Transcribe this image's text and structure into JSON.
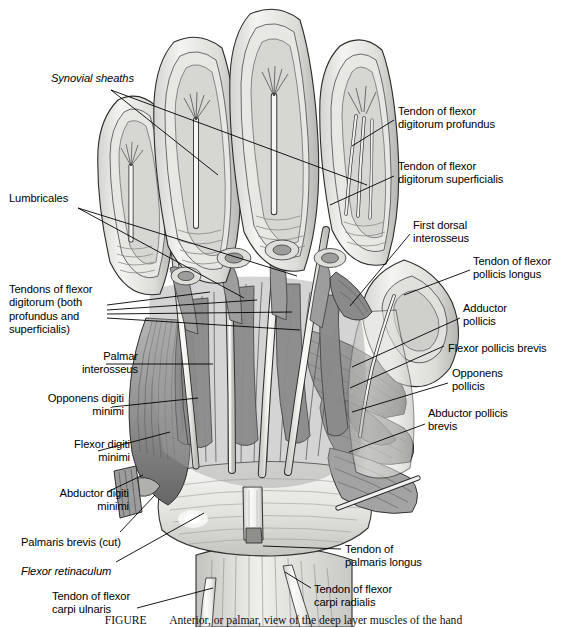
{
  "figure": {
    "domain": "anatomical-illustration",
    "background_color": "#ffffff",
    "ink_color": "#000000",
    "title_region": "Palmar (anterior) view of the dissected right hand showing flexor tendons and intrinsic muscles",
    "caption_prefix": "FIGURE",
    "caption_number": "",
    "caption_text": "FIGURE        Anterior, or palmar, view of the deep layer muscles of the hand",
    "leader_line_color": "#000000",
    "leader_line_width": "0.9"
  },
  "labels_left": [
    {
      "id": "synovial-sheaths",
      "text": "Synovial sheaths",
      "style": "italic",
      "align": "left",
      "x": 51,
      "y": 72,
      "leaders": [
        {
          "x1": 111,
          "y1": 90,
          "x2": 218,
          "y2": 175
        },
        {
          "x1": 111,
          "y1": 90,
          "x2": 367,
          "y2": 185
        }
      ]
    },
    {
      "id": "lumbricales",
      "text": "Lumbricales",
      "style": "regular",
      "align": "left",
      "x": 9,
      "y": 192,
      "leaders": [
        {
          "x1": 78,
          "y1": 208,
          "x2": 244,
          "y2": 298
        },
        {
          "x1": 78,
          "y1": 208,
          "x2": 297,
          "y2": 276
        }
      ]
    },
    {
      "id": "tendons-flexor-digitorum",
      "text": "Tendons of flexor\ndigitorum (both\nprofundus and\nsuperficialis)",
      "style": "regular",
      "align": "left",
      "x": 9,
      "y": 283,
      "leaders": [
        {
          "x1": 107,
          "y1": 305,
          "x2": 210,
          "y2": 292
        },
        {
          "x1": 107,
          "y1": 310,
          "x2": 257,
          "y2": 300
        },
        {
          "x1": 107,
          "y1": 314,
          "x2": 292,
          "y2": 312
        },
        {
          "x1": 107,
          "y1": 318,
          "x2": 300,
          "y2": 330
        }
      ]
    },
    {
      "id": "palmar-interosseus",
      "text": "Palmar\ninterosseus",
      "style": "regular",
      "align": "right",
      "x": 28,
      "y": 350,
      "leaders": [
        {
          "x1": 106,
          "y1": 364,
          "x2": 213,
          "y2": 364
        }
      ]
    },
    {
      "id": "opponens-digiti-minimi",
      "text": "Opponens digiti\nminimi",
      "style": "regular",
      "align": "right",
      "x": 14,
      "y": 392,
      "leaders": [
        {
          "x1": 112,
          "y1": 407,
          "x2": 198,
          "y2": 398
        }
      ]
    },
    {
      "id": "flexor-digiti-minimi",
      "text": "Flexor digiti\nminimi",
      "style": "regular",
      "align": "right",
      "x": 20,
      "y": 438,
      "leaders": [
        {
          "x1": 98,
          "y1": 451,
          "x2": 170,
          "y2": 432
        }
      ]
    },
    {
      "id": "abductor-digiti-minimi",
      "text": "Abductor digiti\nminimi",
      "style": "regular",
      "align": "right",
      "x": 19,
      "y": 487,
      "leaders": [
        {
          "x1": 107,
          "y1": 492,
          "x2": 143,
          "y2": 475
        }
      ]
    },
    {
      "id": "palmaris-brevis-cut",
      "text": "Palmaris brevis (cut)",
      "style": "regular",
      "align": "left",
      "x": 21,
      "y": 536,
      "leaders": [
        {
          "x1": 120,
          "y1": 532,
          "x2": 155,
          "y2": 495
        }
      ]
    },
    {
      "id": "flexor-retinaculum",
      "text": "Flexor retinaculum",
      "style": "italic",
      "align": "left",
      "x": 21,
      "y": 565,
      "leaders": [
        {
          "x1": 116,
          "y1": 562,
          "x2": 204,
          "y2": 513
        }
      ]
    },
    {
      "id": "tendon-flexor-carpi-ulnaris",
      "text": "Tendon of flexor\ncarpi ulnaris",
      "style": "regular",
      "align": "left",
      "x": 52,
      "y": 590,
      "leaders": [
        {
          "x1": 137,
          "y1": 608,
          "x2": 213,
          "y2": 588
        }
      ]
    }
  ],
  "labels_right": [
    {
      "id": "tendon-flexor-digitorum-profundus",
      "text": "Tendon of flexor\ndigitorum profundus",
      "style": "regular",
      "align": "left",
      "x": 398,
      "y": 105,
      "leaders": [
        {
          "x1": 394,
          "y1": 120,
          "x2": 352,
          "y2": 146
        }
      ]
    },
    {
      "id": "tendon-flexor-digitorum-superficialis",
      "text": "Tendon of flexor\ndigitorum superficialis",
      "style": "regular",
      "align": "left",
      "x": 398,
      "y": 160,
      "leaders": [
        {
          "x1": 394,
          "y1": 176,
          "x2": 330,
          "y2": 205
        }
      ]
    },
    {
      "id": "first-dorsal-interosseus",
      "text": "First dorsal\ninterosseus",
      "style": "regular",
      "align": "left",
      "x": 413,
      "y": 219,
      "leaders": [
        {
          "x1": 410,
          "y1": 234,
          "x2": 350,
          "y2": 306
        }
      ]
    },
    {
      "id": "tendon-flexor-pollicis-longus",
      "text": "Tendon of flexor\npollicis longus",
      "style": "left",
      "align": "left",
      "x": 473,
      "y": 255,
      "leaders": [
        {
          "x1": 470,
          "y1": 270,
          "x2": 404,
          "y2": 295
        }
      ]
    },
    {
      "id": "adductor-pollicis",
      "text": "Adductor\npollicis",
      "style": "regular",
      "align": "left",
      "x": 463,
      "y": 302,
      "leaders": [
        {
          "x1": 460,
          "y1": 318,
          "x2": 352,
          "y2": 367
        }
      ]
    },
    {
      "id": "flexor-pollicis-brevis",
      "text": "Flexor pollicis brevis",
      "style": "regular",
      "align": "left",
      "x": 448,
      "y": 342,
      "leaders": [
        {
          "x1": 444,
          "y1": 346,
          "x2": 350,
          "y2": 388
        }
      ]
    },
    {
      "id": "opponens-pollicis",
      "text": "Opponens\npollicis",
      "style": "regular",
      "align": "left",
      "x": 452,
      "y": 367,
      "leaders": [
        {
          "x1": 448,
          "y1": 383,
          "x2": 352,
          "y2": 412
        }
      ]
    },
    {
      "id": "abductor-pollicis-brevis",
      "text": "Abductor pollicis\nbrevis",
      "style": "regular",
      "align": "left",
      "x": 428,
      "y": 407,
      "leaders": [
        {
          "x1": 425,
          "y1": 424,
          "x2": 349,
          "y2": 452
        }
      ]
    },
    {
      "id": "tendon-palmaris-longus",
      "text": "Tendon of\npalmaris longus",
      "style": "regular",
      "align": "left",
      "x": 345,
      "y": 543,
      "leaders": [
        {
          "x1": 341,
          "y1": 549,
          "x2": 263,
          "y2": 546
        }
      ]
    },
    {
      "id": "tendon-flexor-carpi-radialis",
      "text": "Tendon of flexor\ncarpi radialis",
      "style": "regular",
      "align": "left",
      "x": 314,
      "y": 583,
      "leaders": [
        {
          "x1": 311,
          "y1": 588,
          "x2": 285,
          "y2": 572
        }
      ]
    }
  ],
  "palette": {
    "muscle_mid": "#9a9a9a",
    "muscle_dark": "#6e6e6e",
    "muscle_darkest": "#4b4b4b",
    "tendon_light": "#f2f2f0",
    "tendon_shade": "#d6d6d2",
    "skin_light": "#ebebe9",
    "skin_mid": "#c9c9c6",
    "outline": "#2a2a2a",
    "retinaculum": "#e6e6e3"
  }
}
